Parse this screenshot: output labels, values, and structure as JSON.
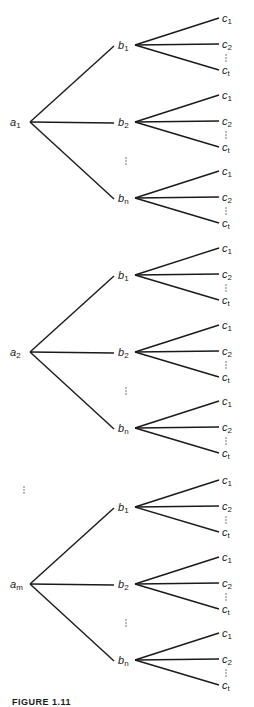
{
  "figure": {
    "caption": "FIGURE 1.11",
    "type": "tree-diagram"
  },
  "tree": {
    "level1": [
      {
        "label": "a",
        "sub": "1",
        "y": 122
      },
      {
        "label": "a",
        "sub": "2",
        "y": 352
      },
      {
        "label": "a",
        "sub": "m",
        "y": 584
      }
    ],
    "level2_labels": [
      {
        "label": "b",
        "sub": "1"
      },
      {
        "label": "b",
        "sub": "2"
      },
      {
        "label": "b",
        "sub": "n"
      }
    ],
    "level3_labels": [
      {
        "label": "c",
        "sub": "1"
      },
      {
        "label": "c",
        "sub": "2"
      },
      {
        "label": "c",
        "sub": "t"
      }
    ],
    "ellipsis": "⋮",
    "layout": {
      "a_x": 30,
      "b_x": 132,
      "c_x": 222,
      "b_offsets": [
        -77,
        0,
        76
      ],
      "c_offsets": [
        -26,
        0,
        26
      ]
    }
  }
}
